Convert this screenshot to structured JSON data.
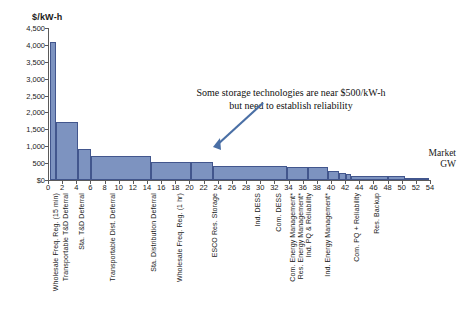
{
  "chart_data": {
    "type": "bar",
    "title": "",
    "ylabel": "$/kW-h",
    "xlabel": "",
    "ylim": [
      0,
      4500
    ],
    "xlim": [
      0,
      54
    ],
    "ytick_labels": [
      "$0",
      "500",
      "1,000",
      "1,500",
      "2,000",
      "2,500",
      "3,000",
      "3,500",
      "4,000",
      "4,500"
    ],
    "ytick_values": [
      0,
      500,
      1000,
      1500,
      2000,
      2500,
      3000,
      3500,
      4000,
      4500
    ],
    "xtick_labels": [
      "0",
      "2",
      "4",
      "6",
      "8",
      "10",
      "12",
      "14",
      "16",
      "18",
      "20",
      "22",
      "24",
      "26",
      "28",
      "30",
      "32",
      "34",
      "36",
      "38",
      "40",
      "42",
      "44",
      "46",
      "48",
      "50",
      "52",
      "54"
    ],
    "xtick_values": [
      0,
      2,
      4,
      6,
      8,
      10,
      12,
      14,
      16,
      18,
      20,
      22,
      24,
      26,
      28,
      30,
      32,
      34,
      36,
      38,
      40,
      42,
      44,
      46,
      48,
      50,
      52,
      54
    ],
    "grid": false,
    "legend": "none",
    "bar_color": "#7d93c0",
    "bar_edge_color": "#42568d",
    "x_units": "GW (cumulative market size)",
    "y_units": "$/kW-h (value of storage)",
    "categories": [
      "Wholesale Freq. Reg. (15 min)",
      "Transportable T&D Deferral",
      "Sta. T&D Deferral",
      "Transportable Dist. Deferral",
      "Sta. Distribution Deferral",
      "Wholesale Freq. Reg. (1 hr)",
      "ESCO Res. Storage",
      "Ind. DESS",
      "Com. DESS",
      "Com. Energy Management*",
      "Res. Energy Management*",
      "Ind. PQ & Reliability",
      "Ind. Energy Management*",
      "Com. PQ + Reliability",
      "Res. Backup"
    ],
    "bars": [
      {
        "label": "Wholesale Freq. Reg. (15 min)",
        "x0": 0.3,
        "x1": 1.1,
        "value": 4100
      },
      {
        "label": "Transportable T&D Deferral",
        "x0": 1.1,
        "x1": 4.2,
        "value": 1720
      },
      {
        "label": "Sta. T&D Deferral",
        "x0": 4.2,
        "x1": 6.1,
        "value": 930
      },
      {
        "label": "Transportable Dist. Deferral",
        "x0": 6.1,
        "x1": 14.6,
        "value": 720
      },
      {
        "label": "Sta. Distribution Deferral",
        "x0": 14.6,
        "x1": 20.2,
        "value": 530
      },
      {
        "label": "Wholesale Freq. Reg. (1 hr)",
        "x0": 20.2,
        "x1": 23.3,
        "value": 520
      },
      {
        "label": "ESCO Res. Storage",
        "x0": 23.3,
        "x1": 33.8,
        "value": 410
      },
      {
        "label": "Ind. DESS",
        "x0": 33.8,
        "x1": 36.8,
        "value": 400
      },
      {
        "label": "Com. DESS",
        "x0": 36.8,
        "x1": 39.6,
        "value": 390
      },
      {
        "label": "Com. Energy Management*",
        "x0": 39.6,
        "x1": 41.2,
        "value": 260
      },
      {
        "label": "Res. Energy Management*",
        "x0": 41.2,
        "x1": 42.1,
        "value": 210
      },
      {
        "label": "Ind. PQ & Reliability",
        "x0": 42.1,
        "x1": 42.9,
        "value": 170
      },
      {
        "label": "Ind. Energy Management*",
        "x0": 42.9,
        "x1": 48.0,
        "value": 130
      },
      {
        "label": "Com. PQ + Reliability",
        "x0": 48.0,
        "x1": 50.4,
        "value": 120
      },
      {
        "label": "Res. Backup",
        "x0": 50.4,
        "x1": 53.8,
        "value": 30
      }
    ],
    "annotations": [
      {
        "name": "callout",
        "line1": "Some storage technologies are near $500/kW-h",
        "line2": "but need to establish reliability"
      },
      {
        "name": "market-axis-note",
        "line1": "Market",
        "line2": "GW"
      }
    ]
  },
  "cat_label_x": [
    52,
    62,
    78,
    109,
    150,
    176,
    211,
    254,
    275,
    289,
    297,
    305,
    324,
    353,
    373
  ]
}
